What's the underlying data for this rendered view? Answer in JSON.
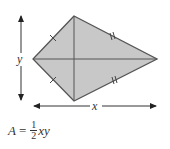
{
  "figure": {
    "shape": "kite",
    "fill_color": "#c8c8c8",
    "stroke_color": "#555555",
    "vertices": {
      "top": [
        74,
        16
      ],
      "left": [
        33,
        59
      ],
      "right": [
        157,
        59
      ],
      "bottom": [
        74,
        101
      ]
    },
    "labels": {
      "vertical_diagonal": "y",
      "horizontal_diagonal": "x"
    },
    "tick_marks": {
      "short_sides": "single",
      "long_sides": "double"
    }
  },
  "formula": {
    "lhs": "A",
    "equals": "=",
    "numerator": "1",
    "denominator": "2",
    "rhs": "xy"
  }
}
